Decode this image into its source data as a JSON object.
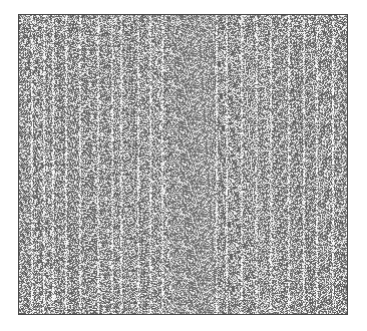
{
  "figure": {
    "colors": {
      "background": "#ffffff",
      "border": "#4a4a4a",
      "dot_dark": "#5a5a5a",
      "dot_light": "#f4f4f4"
    },
    "streak_columns": [
      12,
      24,
      33,
      46,
      60,
      78,
      92,
      101,
      118,
      130,
      142,
      196,
      206,
      221,
      236,
      250,
      268,
      283,
      296,
      312
    ]
  }
}
